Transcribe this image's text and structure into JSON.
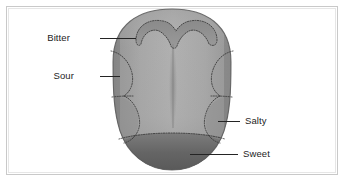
{
  "figure": {
    "background_color": "#ffffff",
    "frame_color": "#c9c9c9"
  },
  "tongue": {
    "body_color": "#a9a9a9",
    "body_edge_color": "#6f6f6f",
    "midline_color": "#8d8d8d",
    "outline_color": "#4a4a4a",
    "divider_color": "#3a3a3a"
  },
  "labels": [
    {
      "id": "bitter",
      "text": "Bitter",
      "side": "left",
      "text_x": 70,
      "text_y": 41,
      "leader_from_x": 100,
      "leader_from_y": 38,
      "leader_to_x": 136,
      "leader_to_y": 38,
      "zone_color": "#8f8f8f"
    },
    {
      "id": "sour",
      "text": "Sour",
      "side": "left",
      "text_x": 74,
      "text_y": 79,
      "leader_from_x": 100,
      "leader_from_y": 76,
      "leader_to_x": 120,
      "leader_to_y": 76,
      "zone_color": "#9d9d9d"
    },
    {
      "id": "salty",
      "text": "Salty",
      "side": "right",
      "text_x": 245,
      "text_y": 124,
      "leader_from_x": 218,
      "leader_from_y": 121,
      "leader_to_x": 240,
      "leader_to_y": 121,
      "zone_color": "#8a8a8a"
    },
    {
      "id": "sweet",
      "text": "Sweet",
      "side": "right",
      "text_x": 243,
      "text_y": 157,
      "leader_from_x": 190,
      "leader_from_y": 154,
      "leader_to_x": 238,
      "leader_to_y": 154,
      "zone_color": "#5e5e5e"
    }
  ],
  "zones": {
    "bitter_label": "Bitter",
    "sour_label": "Sour",
    "salty_label": "Salty",
    "sweet_label": "Sweet"
  }
}
